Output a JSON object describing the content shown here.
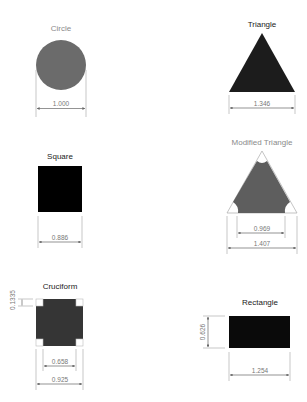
{
  "diagram": {
    "shapes": [
      {
        "id": "circle",
        "title": "Circle",
        "dimensions": {
          "diameter": "1.000"
        },
        "fill": "#6b6b6b"
      },
      {
        "id": "triangle",
        "title": "Triangle",
        "dimensions": {
          "base": "1.346"
        },
        "fill": "#1c1c1c"
      },
      {
        "id": "square",
        "title": "Square",
        "dimensions": {
          "side": "0.886"
        },
        "fill": "#000000"
      },
      {
        "id": "modified-triangle",
        "title": "Modified Triangle",
        "dimensions": {
          "inner_base": "0.969",
          "outer_base": "1.407"
        },
        "fill": "#5e5e5e"
      },
      {
        "id": "cruciform",
        "title": "Cruciform",
        "dimensions": {
          "notch": "0.1335",
          "inner_width": "0.658",
          "outer_width": "0.925"
        },
        "fill": "#353535"
      },
      {
        "id": "rectangle",
        "title": "Rectangle",
        "dimensions": {
          "height": "0.626",
          "width": "1.254"
        },
        "fill": "#0a0a0a"
      }
    ]
  },
  "colors": {
    "circle": "#6b6b6b",
    "triangle": "#1c1c1c",
    "square": "#000000",
    "modified_triangle": "#5e5e5e",
    "cruciform": "#353535",
    "rectangle": "#0a0a0a",
    "dimension_line": "#b0b0b0",
    "label_light": "#8a8a8a"
  }
}
